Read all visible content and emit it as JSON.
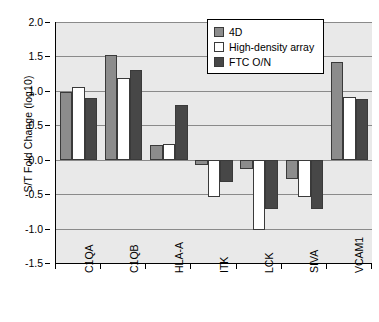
{
  "chart_data": {
    "type": "bar",
    "title": "",
    "xlabel": "",
    "ylabel": "S/T Fold Change (log10)",
    "ylim": [
      -1.5,
      2.0
    ],
    "ytick_step": 0.5,
    "yticks": [
      "2.0",
      "1.5",
      "1.0",
      "0.5",
      "0.0",
      "-0.5",
      "-1.0",
      "-1.5"
    ],
    "ytick_values": [
      2.0,
      1.5,
      1.0,
      0.5,
      0.0,
      -0.5,
      -1.0,
      -1.5
    ],
    "grid": true,
    "legend_position": "top-right",
    "categories": [
      "C1QA",
      "C1QB",
      "HLA-A",
      "ITK",
      "LCK",
      "SIVA",
      "VCAM1"
    ],
    "series": [
      {
        "name": "4D",
        "color": "#8c8c8c",
        "values": [
          0.98,
          1.52,
          0.22,
          -0.07,
          -0.13,
          -0.28,
          1.42
        ]
      },
      {
        "name": "High-density array",
        "color": "#ffffff",
        "values": [
          1.05,
          1.18,
          0.23,
          -0.54,
          -1.02,
          -0.54,
          0.91
        ]
      },
      {
        "name": "FTC O/N",
        "color": "#474747",
        "values": [
          0.89,
          1.31,
          0.8,
          -0.32,
          -0.71,
          -0.72,
          0.88
        ]
      }
    ],
    "plot_background": "#e9e9e9",
    "gridline_color": "#8a8a8a",
    "axis_color": "#000000"
  }
}
